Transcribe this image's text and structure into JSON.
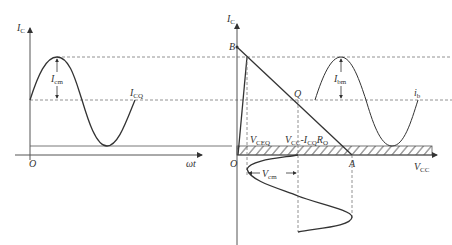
{
  "diagram": {
    "left_plot": {
      "y_axis_label": "I",
      "y_axis_sub": "C",
      "x_axis_label": "ωt",
      "origin_label": "O",
      "amplitude_label": "I",
      "amplitude_sub": "cm",
      "quiescent_label": "I",
      "quiescent_sub": "CQ"
    },
    "right_plot": {
      "y_axis_label": "I",
      "y_axis_sub": "C",
      "x_axis_label": "V",
      "x_axis_sub": "CC",
      "origin_label": "O",
      "point_b": "B",
      "point_q": "Q",
      "point_a": "A",
      "amplitude_label": "I",
      "amplitude_sub": "bm",
      "base_current_label": "i",
      "base_current_sub": "b",
      "vceq_label": "V",
      "vceq_sub": "CEQ",
      "vcc_minus_label": "V",
      "vcc_minus_sub": "CC",
      "vcc_minus_rest": "-I",
      "vcc_minus_sub2": "CQ",
      "vcc_minus_r": "R",
      "vcc_minus_sub3": "O",
      "vcm_label": "V",
      "vcm_sub": "cm"
    }
  }
}
